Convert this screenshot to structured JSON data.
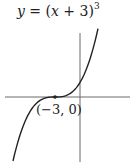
{
  "chart_data": {
    "type": "line",
    "title_parts": {
      "lhs": "y",
      "eq": " = (",
      "var": "x",
      "rest": " + 3)",
      "exponent": "3"
    },
    "function": "y = (x + 3)^3",
    "xlabel": "",
    "ylabel": "",
    "grid": false,
    "axes": "cross at origin, no ticks",
    "annotations": [
      {
        "label": "(−3, 0)",
        "x": -3,
        "y": 0,
        "marker": "point"
      }
    ],
    "series": [
      {
        "name": "y = (x + 3)^3",
        "shape": "cubic with inflection at (-3, 0)",
        "stroke": "#222222"
      }
    ]
  },
  "colors": {
    "axis": "#6a6a6a",
    "curve": "#222222",
    "text": "#222222",
    "background": "#ffffff"
  }
}
